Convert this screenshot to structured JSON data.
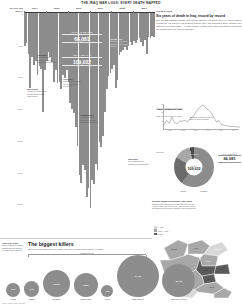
{
  "masthead": {
    "title": "The Iraq war logs: every death mapped"
  },
  "main_chart": {
    "yaxis_title": "DEATHS PER MONTH",
    "callouts": [
      {
        "label": "CIVILIAN DEATHS",
        "value": "66,081"
      },
      {
        "label": "TOTAL DEATHS",
        "value": "109,032"
      }
    ],
    "annotations": [
      {
        "title": "March 2003",
        "body": "Invasion of Iraq begins; coalition forces enter from Kuwait"
      },
      {
        "title": "April 2003",
        "body": "Fall of Baghdad; Saddam Hussein's government collapses"
      },
      {
        "title": "April 2004",
        "body": "First battle of Fallujah; Abu Ghraib abuse revealed"
      },
      {
        "title": "February 2006",
        "body": "Al-Askari mosque bombing in Samarra triggers sectarian war"
      },
      {
        "title": "January 2007",
        "body": "US announces troop surge of 20,000 extra soldiers"
      },
      {
        "title": "June 2009",
        "body": "US combat troops withdraw from Iraqi cities"
      }
    ]
  },
  "chart_data": {
    "type": "bar",
    "xlabel": "",
    "ylabel": "Deaths per month",
    "orientation": "inverted",
    "ylim": [
      0,
      3500
    ],
    "yticks": [
      "0",
      "500",
      "1,000",
      "1,500",
      "2,000",
      "2,500",
      "3,000"
    ],
    "xticks": [
      "2004",
      "2005",
      "2006",
      "2007",
      "2008",
      "2009"
    ],
    "categories": [
      "2004-01",
      "2004-02",
      "2004-03",
      "2004-04",
      "2004-05",
      "2004-06",
      "2004-07",
      "2004-08",
      "2004-09",
      "2004-10",
      "2004-11",
      "2004-12",
      "2005-01",
      "2005-02",
      "2005-03",
      "2005-04",
      "2005-05",
      "2005-06",
      "2005-07",
      "2005-08",
      "2005-09",
      "2005-10",
      "2005-11",
      "2005-12",
      "2006-01",
      "2006-02",
      "2006-03",
      "2006-04",
      "2006-05",
      "2006-06",
      "2006-07",
      "2006-08",
      "2006-09",
      "2006-10",
      "2006-11",
      "2006-12",
      "2007-01",
      "2007-02",
      "2007-03",
      "2007-04",
      "2007-05",
      "2007-06",
      "2007-07",
      "2007-08",
      "2007-09",
      "2007-10",
      "2007-11",
      "2007-12",
      "2008-01",
      "2008-02",
      "2008-03",
      "2008-04",
      "2008-05",
      "2008-06",
      "2008-07",
      "2008-08",
      "2008-09",
      "2008-10",
      "2008-11",
      "2008-12",
      "2009-01",
      "2009-02",
      "2009-03",
      "2009-04",
      "2009-05",
      "2009-06",
      "2009-07",
      "2009-08",
      "2009-09",
      "2009-10",
      "2009-11",
      "2009-12"
    ],
    "values": [
      520,
      480,
      640,
      1180,
      700,
      820,
      760,
      980,
      840,
      880,
      1560,
      900,
      760,
      620,
      700,
      780,
      1080,
      900,
      1100,
      1080,
      1200,
      980,
      1020,
      900,
      1080,
      1420,
      1520,
      1580,
      1800,
      2100,
      2560,
      2680,
      2400,
      2480,
      2900,
      2760,
      3080,
      2640,
      2700,
      2380,
      2480,
      2040,
      2120,
      1940,
      1560,
      1200,
      1000,
      940,
      880,
      820,
      1180,
      1060,
      660,
      620,
      580,
      540,
      580,
      520,
      460,
      500,
      440,
      480,
      420,
      400,
      460,
      520,
      420,
      640,
      380,
      400,
      360,
      380
    ]
  },
  "right_column": {
    "kicker": "THE WAR LOGS",
    "headline": "Six years of death in Iraq, record by record",
    "standfirst": "The 391,832 classified military field reports leaked to Wikileaks log every violent incident recorded by US forces in Iraq between January 2004 and December 2009. Together they catalogue 109,032 deaths — 66,081 of them civilians. This is the most detailed account of the human cost of the war yet published."
  },
  "inset_line": {
    "title": "Violent deaths over time",
    "subtitle": "Total recorded deaths per month",
    "note": "Sectarian killings peak in winter 2006-07 before the surge",
    "chart_data": {
      "type": "line",
      "title": "Violent deaths over time",
      "xlabel": "",
      "ylabel": "Deaths",
      "ylim": [
        0,
        3200
      ],
      "yticks": [
        "0",
        "1k",
        "2k",
        "3k"
      ],
      "xticks": [
        "2004",
        "2005",
        "2006",
        "2007",
        "2008",
        "2009"
      ],
      "x": [
        "2004",
        "2005",
        "2006",
        "2007",
        "2008",
        "2009"
      ],
      "values": [
        820,
        960,
        2100,
        2300,
        760,
        440
      ],
      "points": [
        700,
        1180,
        820,
        1560,
        900,
        760,
        1080,
        1100,
        1200,
        980,
        1420,
        1580,
        2100,
        2560,
        2900,
        3080,
        2700,
        2480,
        2120,
        1560,
        1000,
        1180,
        660,
        580,
        520,
        460,
        440,
        420,
        380,
        360
      ]
    }
  },
  "donut": {
    "legend": "Who died",
    "center_label": "TOTAL",
    "center_value": "109,032",
    "segments": [
      {
        "name": "CIVILIAN",
        "value": "66,081",
        "share": 60.6,
        "color": "#8d8d8d"
      },
      {
        "name": "HOST NATION",
        "value": "23,984",
        "share": 22.0,
        "color": "#6b6b6b"
      },
      {
        "name": "ENEMY",
        "value": "15,196",
        "share": 13.9,
        "color": "#a8a8a8"
      },
      {
        "name": "COALITION",
        "value": "3,771",
        "share": 3.5,
        "color": "#4a4a4a"
      }
    ],
    "side_label": "CIVILIAN DEATHS",
    "side_value": "66,081",
    "footer": [
      "Enemy",
      "Coalition"
    ]
  },
  "map": {
    "title": "Civilian deaths by province, 2004-2009",
    "body": "Baghdad alone accounts for almost half of all recorded civilian deaths. The provinces of Anbar, Nineveh, Diyala and Salah ad Din form the remainder of the worst-hit belt.",
    "legend": [
      {
        "label": "0 - 999",
        "color": "#d8d8d8"
      },
      {
        "label": "1,000 - 4,999",
        "color": "#a8a8a8"
      },
      {
        "label": "5,000 +",
        "color": "#5a5a5a"
      }
    ],
    "provinces": [
      {
        "name": "Nineveh",
        "value": "6,223"
      },
      {
        "name": "Anbar",
        "value": "5,870"
      },
      {
        "name": "Baghdad",
        "value": "28,950"
      },
      {
        "name": "Diyala",
        "value": "4,420"
      },
      {
        "name": "Salah ad Din",
        "value": "3,980"
      },
      {
        "name": "Babil",
        "value": "2,610"
      },
      {
        "name": "Basra",
        "value": "2,040"
      },
      {
        "name": "Kirkuk",
        "value": "1,880"
      },
      {
        "name": "Erbil",
        "value": "310"
      },
      {
        "name": "Najaf",
        "value": "640"
      }
    ]
  },
  "killers": {
    "side_title": "HOW THEY DIED",
    "side_body": "Every death in the logs is tagged with the weapon or method that caused it.",
    "title": "The biggest killers",
    "subtitle": "Recorded deaths attributed to each cause, 2004-2009. Circles sized by number of deaths.",
    "scale_label": "Deaths, 2004-09",
    "items": [
      {
        "name": "Mortar",
        "value": "2,700",
        "size": 7.2
      },
      {
        "name": "Rocket",
        "value": "3,100",
        "size": 7.8
      },
      {
        "name": "Car bomb",
        "value": "12,200",
        "size": 13.5
      },
      {
        "name": "Suicide bomb",
        "value": "9,800",
        "size": 12.2
      },
      {
        "name": "Sniper",
        "value": "1,900",
        "size": 6.0
      },
      {
        "name": "Small arms fire",
        "value": "34,400",
        "size": 21.0
      },
      {
        "name": "Improvised explosive",
        "value": "21,700",
        "size": 16.5
      }
    ],
    "footnote": "Source: Iraq war logs / Wikileaks"
  }
}
